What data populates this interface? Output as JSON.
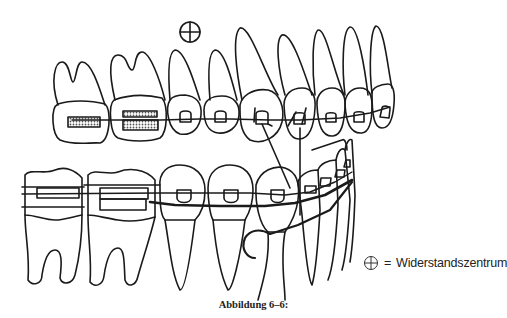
{
  "figure": {
    "resistance_center_symbol": "⊕",
    "colors": {
      "line": "#1a1a1a",
      "background": "#ffffff",
      "stipple": "#9a9a9a"
    }
  },
  "legend": {
    "symbol": "⊕",
    "equals": "=",
    "label": "Widerstandszentrum"
  },
  "caption": "Abbildung 6–6:"
}
